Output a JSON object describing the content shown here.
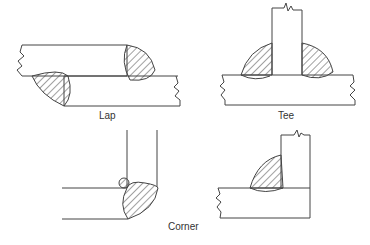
{
  "figure": {
    "labels": {
      "lap": "Lap",
      "tee": "Tee",
      "corner": "Corner"
    },
    "colors": {
      "line": "#444444",
      "hatch": "#444444",
      "background": "#ffffff"
    }
  }
}
